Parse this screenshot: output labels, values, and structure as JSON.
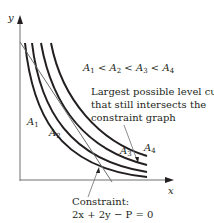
{
  "diagram": {
    "axes": {
      "x_label": "x",
      "y_label": "y"
    },
    "curves": [
      {
        "name": "A1",
        "label_main": "A",
        "label_sub": "1"
      },
      {
        "name": "A2",
        "label_main": "A",
        "label_sub": "2"
      },
      {
        "name": "A3",
        "label_main": "A",
        "label_sub": "3"
      },
      {
        "name": "A4",
        "label_main": "A",
        "label_sub": "4"
      }
    ],
    "ordering": {
      "A": "A",
      "s1": "1",
      "s2": "2",
      "s3": "3",
      "s4": "4",
      "lt": "<"
    },
    "annotation": {
      "line1": "Largest possible level curve",
      "line2": "that still intersects the",
      "line3": "constraint graph"
    },
    "constraint": {
      "title": "Constraint:",
      "equation": "2x + 2y − P = 0"
    },
    "colors": {
      "ink": "#231f20",
      "axis": "#6d6e71"
    }
  }
}
